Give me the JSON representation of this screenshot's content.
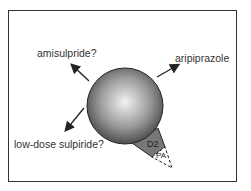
{
  "diagram": {
    "labels": {
      "amisulpride": "amisulpride?",
      "aripiprazole": "aripiprazole",
      "sulpiride": "low-dose sulpiride?",
      "d2": "D2",
      "pa": "PA"
    },
    "colors": {
      "frame": "#333333",
      "sphere_light": "#f2f2f2",
      "sphere_dark": "#3c3c3c",
      "cone": "#777777",
      "text": "#333333"
    }
  }
}
